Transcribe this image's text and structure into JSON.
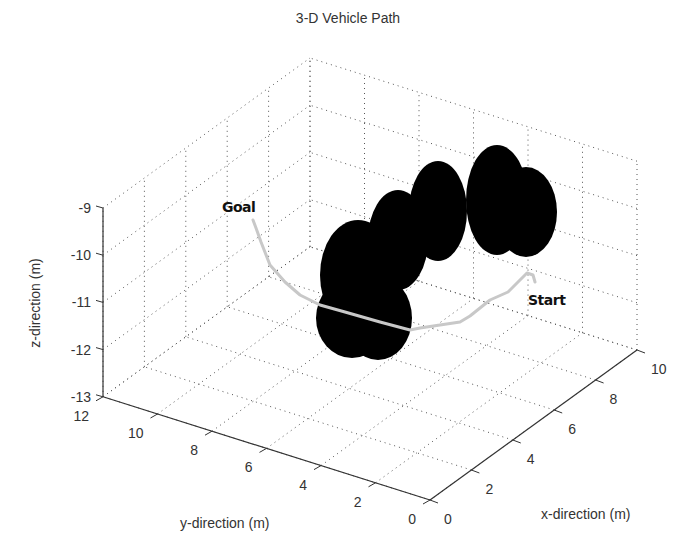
{
  "chart_data": {
    "type": "scatter3d",
    "title": "3-D Vehicle Path",
    "xlabel": "x-direction (m)",
    "ylabel": "y-direction (m)",
    "zlabel": "z-direction (m)",
    "xlim": [
      0,
      10
    ],
    "ylim": [
      0,
      12
    ],
    "zlim": [
      -13,
      -9
    ],
    "x_ticks": [
      0,
      2,
      4,
      6,
      8,
      10
    ],
    "y_ticks": [
      0,
      2,
      4,
      6,
      8,
      10,
      12
    ],
    "z_ticks": [
      -13,
      -12,
      -11,
      -10,
      -9
    ],
    "grid": true,
    "grid_style": "dotted",
    "legend": null,
    "annotations": [
      {
        "text": "Goal",
        "px": [
          222,
          212
        ]
      },
      {
        "text": "Start",
        "px": [
          528,
          305
        ]
      }
    ],
    "path": {
      "name": "vehicle-path",
      "color": "#c8c8c8",
      "description": "Path from Start to Goal winding around obstacles",
      "screen_points": [
        [
          535,
          282
        ],
        [
          533,
          275
        ],
        [
          527,
          273
        ],
        [
          518,
          282
        ],
        [
          508,
          292
        ],
        [
          490,
          300
        ],
        [
          470,
          316
        ],
        [
          460,
          322
        ],
        [
          440,
          325
        ],
        [
          420,
          328
        ],
        [
          410,
          330
        ],
        [
          380,
          322
        ],
        [
          345,
          312
        ],
        [
          320,
          305
        ],
        [
          300,
          295
        ],
        [
          285,
          282
        ],
        [
          270,
          265
        ],
        [
          261,
          242
        ],
        [
          256,
          228
        ],
        [
          253,
          220
        ]
      ]
    },
    "obstacles": {
      "type": "spheres",
      "color": "#000000",
      "screen_ellipses": [
        {
          "cx": 497,
          "cy": 200,
          "rx": 31,
          "ry": 55
        },
        {
          "cx": 526,
          "cy": 212,
          "rx": 31,
          "ry": 45
        },
        {
          "cx": 438,
          "cy": 211,
          "rx": 29,
          "ry": 50
        },
        {
          "cx": 398,
          "cy": 240,
          "rx": 30,
          "ry": 50
        },
        {
          "cx": 358,
          "cy": 275,
          "rx": 38,
          "ry": 55
        },
        {
          "cx": 352,
          "cy": 318,
          "rx": 36,
          "ry": 40
        },
        {
          "cx": 378,
          "cy": 318,
          "rx": 34,
          "ry": 42
        }
      ]
    },
    "projection": {
      "origin_px": [
        430,
        500
      ],
      "ex_px": [
        20.7,
        -15.0
      ],
      "ey_px": [
        -27.25,
        -8.6
      ],
      "ez_px": [
        0,
        -47.2
      ]
    }
  }
}
